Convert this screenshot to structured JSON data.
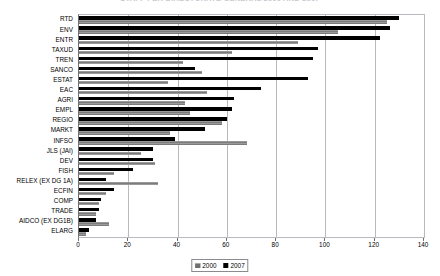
{
  "chart_data": {
    "type": "bar",
    "orientation": "horizontal",
    "title": "STAFF PER DIRECTORATE GENERAL 2000 AND 2007",
    "xlabel": "",
    "ylabel": "",
    "xlim": [
      0,
      140
    ],
    "xticks": [
      0,
      20,
      40,
      60,
      80,
      100,
      120,
      140
    ],
    "grid": true,
    "legend_position": "bottom",
    "categories": [
      "RTD",
      "ENV",
      "ENTR",
      "TAXUD",
      "TREN",
      "SANCO",
      "ESTAT",
      "EAC",
      "AGRI",
      "EMPL",
      "REGIO",
      "MARKT",
      "INFSO",
      "JLS (JAI)",
      "DEV",
      "FISH",
      "RELEX (EX DG 1A)",
      "ECFIN",
      "COMP",
      "TRADE",
      "AIDCO (EX DG1B)",
      "ELARG"
    ],
    "series": [
      {
        "name": "2000",
        "color": "#8a8a8a",
        "values": [
          125,
          105,
          89,
          62,
          42,
          50,
          36,
          52,
          43,
          45,
          58,
          37,
          68,
          25,
          31,
          14,
          32,
          11,
          8,
          7,
          12,
          3
        ]
      },
      {
        "name": "2007",
        "color": "#000000",
        "values": [
          130,
          126,
          122,
          97,
          95,
          47,
          93,
          74,
          63,
          62,
          60,
          51,
          39,
          30,
          30,
          22,
          11,
          14,
          9,
          8,
          7,
          4
        ]
      }
    ]
  },
  "legend": {
    "entries": [
      {
        "label": "2000"
      },
      {
        "label": "2007"
      }
    ]
  }
}
